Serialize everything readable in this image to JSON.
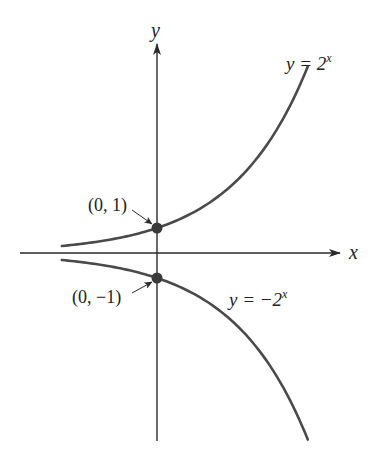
{
  "chart_data": {
    "type": "line",
    "title": "",
    "xlabel": "x",
    "ylabel": "y",
    "grid": false,
    "xlim": [
      -2.6,
      4.1
    ],
    "ylim": [
      -7.5,
      8.4
    ],
    "series": [
      {
        "name": "y = 2^x",
        "expression": "2^x",
        "x_range": [
          -1.83,
          2.9
        ],
        "x": [
          -1.83,
          -1,
          0,
          1,
          2,
          2.9
        ],
        "y": [
          0.28,
          0.5,
          1,
          2,
          4,
          7.46
        ]
      },
      {
        "name": "y = -2^x",
        "expression": "-2^x",
        "x_range": [
          -1.83,
          2.9
        ],
        "x": [
          -1.83,
          -1,
          0,
          1,
          2,
          2.9
        ],
        "y": [
          -0.28,
          -0.5,
          -1,
          -2,
          -4,
          -7.46
        ]
      }
    ],
    "annotations": [
      {
        "text": "(0, 1)",
        "point": [
          0,
          1
        ]
      },
      {
        "text": "(0, −1)",
        "point": [
          0,
          -1
        ]
      }
    ],
    "legend": "inline labels near curves"
  },
  "labels": {
    "x_axis": "x",
    "y_axis": "y",
    "eq_top_prefix": "y = 2",
    "eq_top_exp": "x",
    "eq_bottom_prefix": "y = −2",
    "eq_bottom_exp": "x",
    "point_top": "(0, 1)",
    "point_bottom": "(0, −1)"
  },
  "colors": {
    "axis": "#2a2a2a",
    "curve": "#4a4a4a",
    "point": "#3a3a3a"
  },
  "layout": {
    "origin_px": [
      157,
      253
    ],
    "px_per_x_unit": 52,
    "px_per_y_unit": 25
  }
}
